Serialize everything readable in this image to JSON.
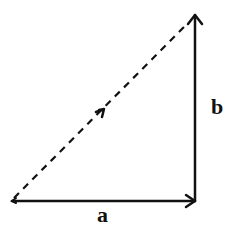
{
  "diagram": {
    "type": "vector-addition-right-triangle",
    "colors": {
      "stroke": "#111111",
      "background": "#ffffff"
    },
    "vectors": [
      {
        "id": "a",
        "label": "a",
        "style": "solid",
        "direction": "right",
        "from": [
          12,
          201
        ],
        "to": [
          195,
          201
        ]
      },
      {
        "id": "b",
        "label": "b",
        "style": "solid",
        "direction": "up",
        "from": [
          195,
          201
        ],
        "to": [
          195,
          15
        ]
      },
      {
        "id": "resultant",
        "label": "",
        "style": "dashed",
        "direction": "down-left",
        "from": [
          185,
          25
        ],
        "to": [
          12,
          201
        ],
        "midpoint_marker": "arrowhead"
      }
    ],
    "labels": {
      "a": "a",
      "b": "b"
    }
  }
}
